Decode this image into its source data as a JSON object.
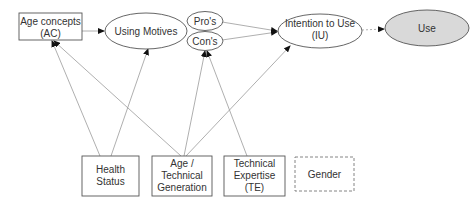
{
  "diagram": {
    "nodes": {
      "age_concepts": {
        "line1": "Age concepts",
        "line2": "(AC)",
        "shape": "rect"
      },
      "using_motives": {
        "label": "Using Motives",
        "shape": "ellipse"
      },
      "pros": {
        "label": "Pro's",
        "shape": "ellipse"
      },
      "cons": {
        "label": "Con's",
        "shape": "ellipse"
      },
      "intention": {
        "line1": "Intention to Use",
        "line2": "(IU)",
        "shape": "ellipse"
      },
      "use": {
        "label": "Use",
        "shape": "ellipse",
        "fill": "#d9d9d9"
      },
      "health_status": {
        "line1": "Health",
        "line2": "Status",
        "shape": "rect"
      },
      "age_generation": {
        "line1": "Age /",
        "line2": "Technical",
        "line3": "Generation",
        "shape": "rect"
      },
      "technical_expertise": {
        "line1": "Technical",
        "line2": "Expertise",
        "line3": "(TE)",
        "shape": "rect"
      },
      "gender": {
        "label": "Gender",
        "shape": "dashed-rect"
      }
    },
    "edges": [
      {
        "from": "Age concepts (AC)",
        "to": "Using Motives"
      },
      {
        "from": "Pro's",
        "to": "Intention to Use (IU)"
      },
      {
        "from": "Con's",
        "to": "Intention to Use (IU)"
      },
      {
        "from": "Intention to Use (IU)",
        "to": "Use",
        "style": "dotted"
      },
      {
        "from": "Health Status",
        "to": "Age concepts (AC)"
      },
      {
        "from": "Health Status",
        "to": "Using Motives"
      },
      {
        "from": "Age / Technical Generation",
        "to": "Age concepts (AC)"
      },
      {
        "from": "Age / Technical Generation",
        "to": "Con's"
      },
      {
        "from": "Age / Technical Generation",
        "to": "Intention to Use (IU)"
      },
      {
        "from": "Technical Expertise (TE)",
        "to": "Con's"
      }
    ],
    "colors": {
      "stroke": "#555555",
      "edge": "#9a9a9a",
      "use_fill": "#d9d9d9",
      "text": "#333333"
    }
  }
}
